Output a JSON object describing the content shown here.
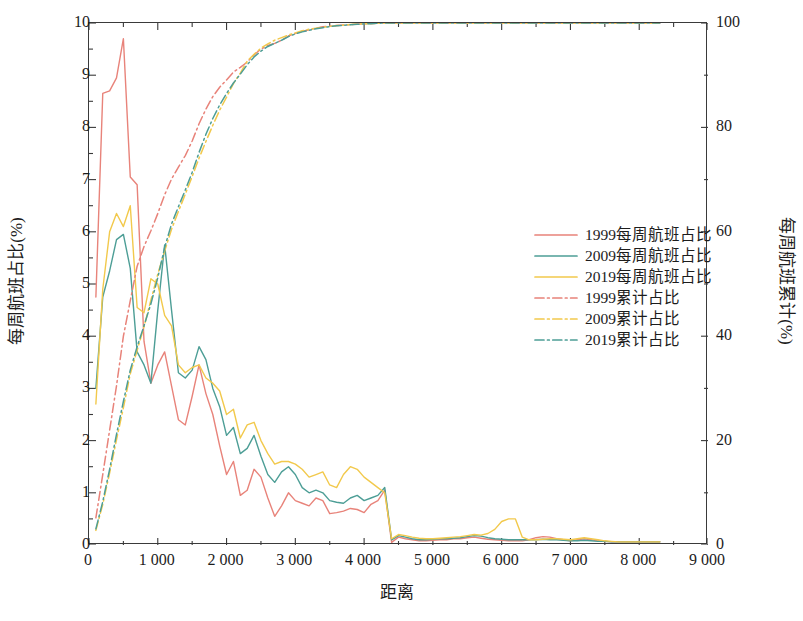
{
  "chart_data": {
    "type": "line",
    "title": "",
    "xlabel": "距离",
    "ylabel": "每周航班占比(%)",
    "ylabel_right": "每周航班累计(%)",
    "xlim": [
      0,
      9000
    ],
    "ylim": [
      0,
      10
    ],
    "ylim_right": [
      0,
      100
    ],
    "xticks": [
      0,
      1000,
      2000,
      3000,
      4000,
      5000,
      6000,
      7000,
      8000,
      9000
    ],
    "xticklabels": [
      "0",
      "1 000",
      "2 000",
      "3 000",
      "4 000",
      "5 000",
      "6 000",
      "7 000",
      "8 000",
      "9 000"
    ],
    "xminor_step": 500,
    "yticks": [
      0,
      1,
      2,
      3,
      4,
      5,
      6,
      7,
      8,
      9,
      10
    ],
    "yticklabels": [
      "0",
      "1",
      "2",
      "3",
      "4",
      "5",
      "6",
      "7",
      "8",
      "9",
      "10"
    ],
    "yminor_step": 0.5,
    "yticks_right": [
      0,
      20,
      40,
      60,
      80,
      100
    ],
    "yticklabels_right": [
      "0",
      "20",
      "40",
      "60",
      "80",
      "100"
    ],
    "yminor_step_right": 10,
    "grid": false,
    "legend_position": "center-right",
    "colors": {
      "series_1999": "#e8837a",
      "series_2009": "#4d9e96",
      "series_2019": "#f2c94c",
      "axis": "#3a3a3a",
      "text": "#1c1c1c"
    },
    "x": [
      100,
      200,
      300,
      400,
      500,
      600,
      700,
      800,
      900,
      1000,
      1100,
      1200,
      1300,
      1400,
      1500,
      1600,
      1700,
      1800,
      1900,
      2000,
      2100,
      2200,
      2300,
      2400,
      2500,
      2600,
      2700,
      2800,
      2900,
      3000,
      3100,
      3200,
      3300,
      3400,
      3500,
      3600,
      3700,
      3800,
      3900,
      4000,
      4100,
      4200,
      4300,
      4400,
      4500,
      4600,
      4700,
      4800,
      4900,
      5000,
      5100,
      5200,
      5300,
      5400,
      5500,
      5600,
      5700,
      5800,
      5900,
      6000,
      6100,
      6200,
      6300,
      6400,
      6500,
      6600,
      6700,
      6800,
      6900,
      7000,
      7100,
      7200,
      7300,
      7400,
      7500,
      7600,
      7700,
      7800,
      7900,
      8000,
      8100,
      8200,
      8300
    ],
    "series": [
      {
        "name": "1999每周航班占比",
        "style": "solid",
        "axis": "left",
        "color": "#e8837a",
        "values": [
          4.75,
          8.65,
          8.7,
          8.95,
          9.7,
          7.05,
          6.9,
          3.9,
          3.1,
          3.45,
          3.7,
          3.05,
          2.4,
          2.3,
          2.85,
          3.45,
          2.9,
          2.5,
          1.9,
          1.35,
          1.6,
          0.95,
          1.05,
          1.45,
          1.3,
          0.9,
          0.55,
          0.75,
          1.0,
          0.85,
          0.8,
          0.75,
          0.9,
          0.85,
          0.6,
          0.62,
          0.65,
          0.7,
          0.68,
          0.62,
          0.78,
          0.85,
          1.05,
          0.05,
          0.15,
          0.12,
          0.1,
          0.08,
          0.08,
          0.09,
          0.1,
          0.1,
          0.12,
          0.12,
          0.14,
          0.15,
          0.13,
          0.11,
          0.1,
          0.09,
          0.08,
          0.08,
          0.08,
          0.1,
          0.14,
          0.16,
          0.15,
          0.12,
          0.1,
          0.08,
          0.1,
          0.12,
          0.1,
          0.08,
          0.07,
          0.06,
          0.06,
          0.06,
          0.06,
          0.06,
          0.06,
          0.06,
          0.06
        ]
      },
      {
        "name": "2009每周航班占比",
        "style": "solid",
        "axis": "left",
        "color": "#4d9e96",
        "values": [
          3.0,
          4.75,
          5.25,
          5.85,
          5.95,
          5.3,
          3.7,
          3.45,
          3.1,
          4.5,
          5.75,
          4.5,
          3.3,
          3.2,
          3.35,
          3.8,
          3.55,
          3.0,
          2.65,
          2.1,
          2.25,
          1.75,
          1.85,
          2.1,
          1.7,
          1.35,
          1.2,
          1.4,
          1.5,
          1.35,
          1.1,
          1.0,
          1.05,
          1.0,
          0.85,
          0.82,
          0.8,
          0.9,
          0.95,
          0.85,
          0.9,
          0.95,
          1.1,
          0.1,
          0.18,
          0.15,
          0.12,
          0.1,
          0.1,
          0.11,
          0.12,
          0.12,
          0.13,
          0.14,
          0.16,
          0.18,
          0.17,
          0.14,
          0.12,
          0.11,
          0.1,
          0.1,
          0.1,
          0.1,
          0.1,
          0.11,
          0.1,
          0.1,
          0.09,
          0.08,
          0.08,
          0.09,
          0.08,
          0.07,
          0.07,
          0.06,
          0.06,
          0.06,
          0.06,
          0.06,
          0.06,
          0.06,
          0.06
        ]
      },
      {
        "name": "2019每周航班占比",
        "style": "solid",
        "axis": "left",
        "color": "#f2c94c",
        "values": [
          2.7,
          4.9,
          6.0,
          6.35,
          6.1,
          6.5,
          4.55,
          4.45,
          5.1,
          5.0,
          4.4,
          4.2,
          3.45,
          3.3,
          3.4,
          3.45,
          3.2,
          3.1,
          2.95,
          2.5,
          2.6,
          2.05,
          2.3,
          2.35,
          2.0,
          1.75,
          1.55,
          1.6,
          1.6,
          1.55,
          1.45,
          1.3,
          1.35,
          1.4,
          1.15,
          1.1,
          1.35,
          1.5,
          1.45,
          1.3,
          1.2,
          1.1,
          1.0,
          0.12,
          0.2,
          0.18,
          0.15,
          0.13,
          0.12,
          0.12,
          0.13,
          0.14,
          0.15,
          0.16,
          0.18,
          0.2,
          0.19,
          0.22,
          0.3,
          0.45,
          0.5,
          0.5,
          0.15,
          0.1,
          0.1,
          0.11,
          0.12,
          0.12,
          0.11,
          0.1,
          0.12,
          0.14,
          0.12,
          0.1,
          0.08,
          0.07,
          0.06,
          0.06,
          0.06,
          0.06,
          0.06,
          0.06,
          0.06
        ]
      },
      {
        "name": "1999累计占比",
        "style": "dashdot",
        "axis": "right",
        "color": "#e8837a",
        "values": [
          5.2,
          13.5,
          22.0,
          30.5,
          40.0,
          46.8,
          53.4,
          57.2,
          60.2,
          63.5,
          67.1,
          70.1,
          72.4,
          74.6,
          77.4,
          80.7,
          83.5,
          85.9,
          87.7,
          89.1,
          90.6,
          91.5,
          92.5,
          93.9,
          95.0,
          95.7,
          96.1,
          96.7,
          97.5,
          98.0,
          98.4,
          98.7,
          99.0,
          99.3,
          99.4,
          99.5,
          99.6,
          99.7,
          99.8,
          99.85,
          99.9,
          99.95,
          100,
          100,
          100,
          100,
          100,
          100,
          100,
          100,
          100,
          100,
          100,
          100,
          100,
          100,
          100,
          100,
          100,
          100,
          100,
          100,
          100,
          100,
          100,
          100,
          100,
          100,
          100,
          100,
          100,
          100,
          100,
          100,
          100,
          100,
          100,
          100,
          100,
          100,
          100,
          100,
          100
        ]
      },
      {
        "name": "2009累计占比",
        "style": "dashdot",
        "axis": "right",
        "color": "#f2c94c",
        "values": [
          2.8,
          7.8,
          13.8,
          20.2,
          26.3,
          32.8,
          37.3,
          41.8,
          46.9,
          51.9,
          56.3,
          60.5,
          63.9,
          67.2,
          70.6,
          74.1,
          77.3,
          80.4,
          83.3,
          85.8,
          88.4,
          90.4,
          92.7,
          94.0,
          95.2,
          96.0,
          96.7,
          97.2,
          97.7,
          98.1,
          98.5,
          98.8,
          99.0,
          99.2,
          99.35,
          99.5,
          99.6,
          99.7,
          99.8,
          99.85,
          99.9,
          99.95,
          100,
          100,
          100,
          100,
          100,
          100,
          100,
          100,
          100,
          100,
          100,
          100,
          100,
          100,
          100,
          100,
          100,
          100,
          100,
          100,
          100,
          100,
          100,
          100,
          100,
          100,
          100,
          100,
          100,
          100,
          100,
          100,
          100,
          100,
          100,
          100,
          100,
          100,
          100,
          100,
          100
        ]
      },
      {
        "name": "2019累计占比",
        "style": "dashdot",
        "axis": "right",
        "color": "#4d9e96",
        "values": [
          3.1,
          8.3,
          14.5,
          21.2,
          27.5,
          33.5,
          38.0,
          42.0,
          46.2,
          51.2,
          57.0,
          61.5,
          64.8,
          68.0,
          71.4,
          75.2,
          78.7,
          81.7,
          84.3,
          86.5,
          88.5,
          90.2,
          92.0,
          93.5,
          94.6,
          95.5,
          96.1,
          96.7,
          97.4,
          97.9,
          98.3,
          98.6,
          98.9,
          99.1,
          99.3,
          99.45,
          99.55,
          99.65,
          99.75,
          99.82,
          99.88,
          99.94,
          100,
          100,
          100,
          100,
          100,
          100,
          100,
          100,
          100,
          100,
          100,
          100,
          100,
          100,
          100,
          100,
          100,
          100,
          100,
          100,
          100,
          100,
          100,
          100,
          100,
          100,
          100,
          100,
          100,
          100,
          100,
          100,
          100,
          100,
          100,
          100,
          100,
          100,
          100,
          100,
          100
        ]
      }
    ],
    "legend": [
      {
        "label": "1999每周航班占比",
        "color": "#e8837a",
        "style": "solid"
      },
      {
        "label": "2009每周航班占比",
        "color": "#4d9e96",
        "style": "solid"
      },
      {
        "label": "2019每周航班占比",
        "color": "#f2c94c",
        "style": "solid"
      },
      {
        "label": "1999累计占比",
        "color": "#e8837a",
        "style": "dashdot"
      },
      {
        "label": "2009累计占比",
        "color": "#f2c94c",
        "style": "dashdot"
      },
      {
        "label": "2019累计占比",
        "color": "#4d9e96",
        "style": "dashdot"
      }
    ]
  }
}
